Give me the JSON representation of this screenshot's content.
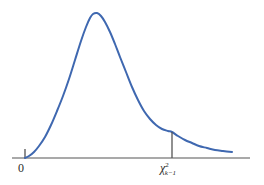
{
  "chart_data": {
    "type": "line",
    "title": "",
    "subtitle": "",
    "xlabel": "",
    "ylabel": "",
    "grid": false,
    "legend": null,
    "legend_position": "none",
    "axis": {
      "x_start_px": 12,
      "x_end_px": 250,
      "baseline_px": 158,
      "color": "#8c8c8c",
      "show_y_axis": false
    },
    "tick_labels": [
      {
        "id": "origin",
        "text": "0",
        "x_px": 25
      },
      {
        "id": "critical-value",
        "text": "χ²k−1",
        "x_px": 172
      }
    ],
    "critical_value": {
      "label_base": "χ",
      "label_superscript": "2",
      "label_subscript": "k−1",
      "x_px": 172,
      "curve_y_px": 131,
      "marker_color": "#555555"
    },
    "series": [
      {
        "name": "chi-square density",
        "color": "#3f68b0",
        "stroke_width": 2,
        "fill": "none",
        "points": [
          [
            25,
            158
          ],
          [
            29,
            156
          ],
          [
            34,
            152
          ],
          [
            39,
            146
          ],
          [
            45,
            137
          ],
          [
            51,
            125
          ],
          [
            57,
            111
          ],
          [
            63,
            96
          ],
          [
            69,
            79
          ],
          [
            75,
            60
          ],
          [
            81,
            41
          ],
          [
            86,
            27
          ],
          [
            90,
            18
          ],
          [
            93,
            14
          ],
          [
            97,
            13
          ],
          [
            101,
            16
          ],
          [
            105,
            22
          ],
          [
            110,
            32
          ],
          [
            115,
            44
          ],
          [
            120,
            57
          ],
          [
            126,
            72
          ],
          [
            132,
            87
          ],
          [
            138,
            100
          ],
          [
            144,
            111
          ],
          [
            150,
            119
          ],
          [
            156,
            125
          ],
          [
            162,
            129
          ],
          [
            168,
            131
          ],
          [
            172,
            132
          ],
          [
            178,
            136
          ],
          [
            185,
            140
          ],
          [
            192,
            143
          ],
          [
            199,
            146
          ],
          [
            207,
            148
          ],
          [
            215,
            150
          ],
          [
            223,
            151
          ],
          [
            232,
            152
          ]
        ]
      }
    ],
    "origin_tick": {
      "x_px": 25,
      "top_px": 149,
      "bottom_px": 158,
      "color": "#444444"
    },
    "colors": {
      "curve": "#3f68b0",
      "axis": "#8c8c8c",
      "marker_line": "#555555",
      "text": "#2a2a2a",
      "background": "#ffffff"
    }
  },
  "figure": {
    "origin_label": "0",
    "critical_label_base": "χ",
    "critical_label_sup": "2",
    "critical_label_sub": "k−1"
  }
}
